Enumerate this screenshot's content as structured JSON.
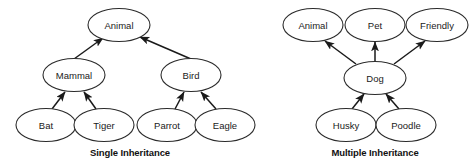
{
  "figure": {
    "title_visible": false,
    "background_color": "#ffffff",
    "stroke_color": "#2b2b2b",
    "edge_color": "#1a1a1a",
    "text_color": "#1a1a1a"
  },
  "diagrams": [
    {
      "id": "single-inheritance",
      "caption": "Single Inheritance",
      "caption_position": {
        "x": 130,
        "y": 152
      },
      "nodes": [
        {
          "id": "animal",
          "label": "Animal",
          "cx": 119,
          "cy": 25,
          "rx": 31,
          "ry": 16.5
        },
        {
          "id": "mammal",
          "label": "Mammal",
          "cx": 74,
          "cy": 75,
          "rx": 31,
          "ry": 16.5
        },
        {
          "id": "bird",
          "label": "Bird",
          "cx": 191,
          "cy": 75,
          "rx": 30,
          "ry": 16.5
        },
        {
          "id": "bat",
          "label": "Bat",
          "cx": 46,
          "cy": 125,
          "rx": 30,
          "ry": 16.5
        },
        {
          "id": "tiger",
          "label": "Tiger",
          "cx": 104,
          "cy": 125,
          "rx": 30,
          "ry": 16.5
        },
        {
          "id": "parrot",
          "label": "Parrot",
          "cx": 167,
          "cy": 125,
          "rx": 30,
          "ry": 16.5
        },
        {
          "id": "eagle",
          "label": "Eagle",
          "cx": 225,
          "cy": 125,
          "rx": 30,
          "ry": 16.5
        }
      ],
      "edges": [
        {
          "id": "mammal-animal",
          "from": "mammal",
          "to": "animal",
          "x1": 74,
          "y1": 59,
          "x2": 103,
          "y2": 38
        },
        {
          "id": "bird-animal",
          "from": "bird",
          "to": "animal",
          "x1": 191,
          "y1": 59,
          "x2": 140,
          "y2": 37
        },
        {
          "id": "bat-mammal",
          "from": "bat",
          "to": "mammal",
          "x1": 52,
          "y1": 109,
          "x2": 65,
          "y2": 92
        },
        {
          "id": "tiger-mammal",
          "from": "tiger",
          "to": "mammal",
          "x1": 96,
          "y1": 109,
          "x2": 84,
          "y2": 92
        },
        {
          "id": "parrot-bird",
          "from": "parrot",
          "to": "bird",
          "x1": 175,
          "y1": 109,
          "x2": 184,
          "y2": 92
        },
        {
          "id": "eagle-bird",
          "from": "eagle",
          "to": "bird",
          "x1": 216,
          "y1": 109,
          "x2": 201,
          "y2": 92
        }
      ]
    },
    {
      "id": "multiple-inheritance",
      "caption": "Multiple Inheritance",
      "caption_position": {
        "x": 375,
        "y": 152
      },
      "nodes": [
        {
          "id": "animal2",
          "label": "Animal",
          "cx": 313,
          "cy": 25,
          "rx": 30,
          "ry": 16.5
        },
        {
          "id": "pet",
          "label": "Pet",
          "cx": 375,
          "cy": 25,
          "rx": 30,
          "ry": 16.5
        },
        {
          "id": "friendly",
          "label": "Friendly",
          "cx": 437,
          "cy": 25,
          "rx": 31,
          "ry": 16.5
        },
        {
          "id": "dog",
          "label": "Dog",
          "cx": 375,
          "cy": 78,
          "rx": 31,
          "ry": 16.5
        },
        {
          "id": "husky",
          "label": "Husky",
          "cx": 346,
          "cy": 125,
          "rx": 30,
          "ry": 16.5
        },
        {
          "id": "poodle",
          "label": "Poodle",
          "cx": 406,
          "cy": 125,
          "rx": 30,
          "ry": 16.5
        }
      ],
      "edges": [
        {
          "id": "dog-animal",
          "from": "dog",
          "to": "animal2",
          "x1": 356,
          "y1": 64,
          "x2": 325,
          "y2": 41
        },
        {
          "id": "dog-pet",
          "from": "dog",
          "to": "pet",
          "x1": 375,
          "y1": 62,
          "x2": 375,
          "y2": 42
        },
        {
          "id": "dog-friendly",
          "from": "dog",
          "to": "friendly",
          "x1": 394,
          "y1": 64,
          "x2": 425,
          "y2": 41
        },
        {
          "id": "husky-dog",
          "from": "husky",
          "to": "dog",
          "x1": 352,
          "y1": 109,
          "x2": 364,
          "y2": 94
        },
        {
          "id": "poodle-dog",
          "from": "poodle",
          "to": "dog",
          "x1": 399,
          "y1": 109,
          "x2": 386,
          "y2": 94
        }
      ]
    }
  ]
}
